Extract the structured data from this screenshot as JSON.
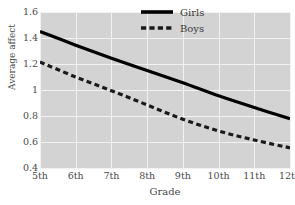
{
  "chart_data": {
    "type": "line",
    "title": "",
    "xlabel": "Grade",
    "ylabel": "Average affect",
    "categories": [
      "5th",
      "6th",
      "7th",
      "8th",
      "9th",
      "10th",
      "11th",
      "12th"
    ],
    "x": [
      5,
      6,
      7,
      8,
      9,
      10,
      11,
      12
    ],
    "xlim": [
      5,
      12
    ],
    "ylim": [
      0.4,
      1.6
    ],
    "yticks": [
      "0.4",
      "0.6",
      "0.8",
      "1",
      "1.2",
      "1.4",
      "1.6"
    ],
    "ytick_values": [
      0.4,
      0.6,
      0.8,
      1.0,
      1.2,
      1.4,
      1.6
    ],
    "grid": true,
    "legend_position": "top-right",
    "series": [
      {
        "name": "Girls",
        "style": "solid",
        "color": "#000000",
        "values": [
          1.45,
          1.345,
          1.245,
          1.15,
          1.055,
          0.955,
          0.865,
          0.78
        ]
      },
      {
        "name": "Boys",
        "style": "dashed",
        "color": "#1a1a1a",
        "values": [
          1.215,
          1.1,
          0.995,
          0.885,
          0.775,
          0.685,
          0.615,
          0.555
        ]
      }
    ]
  },
  "legend": {
    "items": [
      {
        "label": "Girls",
        "style": "solid"
      },
      {
        "label": "Boys",
        "style": "dashed"
      }
    ]
  },
  "colors": {
    "plot_background": "#d3d3d3",
    "gridline": "#f2f2f2",
    "page_background": "#ffffff",
    "tick_text": "#4a4a4a",
    "line": "#000000"
  }
}
